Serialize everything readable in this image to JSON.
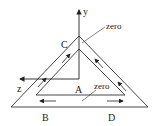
{
  "diagram": {
    "labels": {
      "y_axis": "y",
      "z_axis": "z",
      "zero_top": "zero",
      "zero_bottom": "zero",
      "point_c": "C",
      "point_a": "A",
      "point_b": "B",
      "point_d": "D"
    },
    "colors": {
      "line": "#333333",
      "background": "#ffffff"
    }
  }
}
